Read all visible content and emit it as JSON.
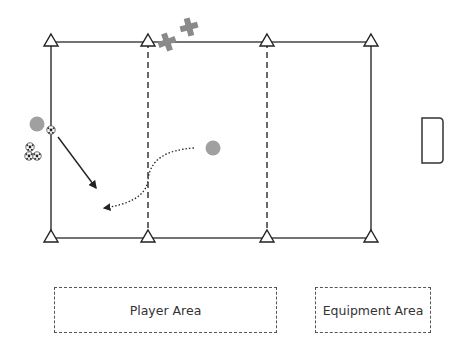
{
  "diagram": {
    "type": "soccer-drill",
    "field": {
      "left": 51,
      "right": 371,
      "top": 42,
      "bottom": 238,
      "line_color": "#333333",
      "dashed_zone_lines_x": [
        148,
        267
      ]
    },
    "cones": [
      {
        "x": 51,
        "y": 42
      },
      {
        "x": 148,
        "y": 42
      },
      {
        "x": 267,
        "y": 42
      },
      {
        "x": 371,
        "y": 42
      },
      {
        "x": 51,
        "y": 238
      },
      {
        "x": 148,
        "y": 238
      },
      {
        "x": 267,
        "y": 238
      },
      {
        "x": 371,
        "y": 238
      }
    ],
    "players": [
      {
        "label": "player-left",
        "x": 37,
        "y": 124,
        "color": "#a0a0a0"
      },
      {
        "label": "player-center",
        "x": 213,
        "y": 148,
        "color": "#a0a0a0"
      }
    ],
    "defenders_cross": [
      {
        "x": 167,
        "y": 42
      },
      {
        "x": 189,
        "y": 27
      }
    ],
    "cross_color": "#8a8a8a",
    "balls": [
      {
        "x": 51,
        "y": 130
      },
      {
        "x": 29,
        "y": 147
      },
      {
        "x": 29,
        "y": 156
      },
      {
        "x": 37,
        "y": 156
      }
    ],
    "goal": {
      "x": 422,
      "y": 118,
      "w": 21,
      "h": 45
    },
    "pass_arrow": {
      "from": [
        58,
        137
      ],
      "to": [
        97,
        189
      ],
      "style": "solid"
    },
    "run_arrow": {
      "from": [
        194,
        148
      ],
      "to": [
        103,
        208
      ],
      "style": "dotted"
    }
  },
  "labels": {
    "player_area": "Player Area",
    "equipment_area": "Equipment Area"
  }
}
